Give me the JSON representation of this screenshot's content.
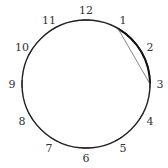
{
  "diagram": {
    "type": "clock-circle",
    "center": [
      86,
      84
    ],
    "radius": 64,
    "stroke_color": "#222222",
    "chord_color": "#777777",
    "labels": [
      "12",
      "1",
      "2",
      "3",
      "4",
      "5",
      "6",
      "7",
      "8",
      "9",
      "10",
      "11"
    ],
    "chord": {
      "from": "1",
      "to": "3"
    },
    "highlighted_arc": {
      "from": "1",
      "to": "3"
    }
  }
}
